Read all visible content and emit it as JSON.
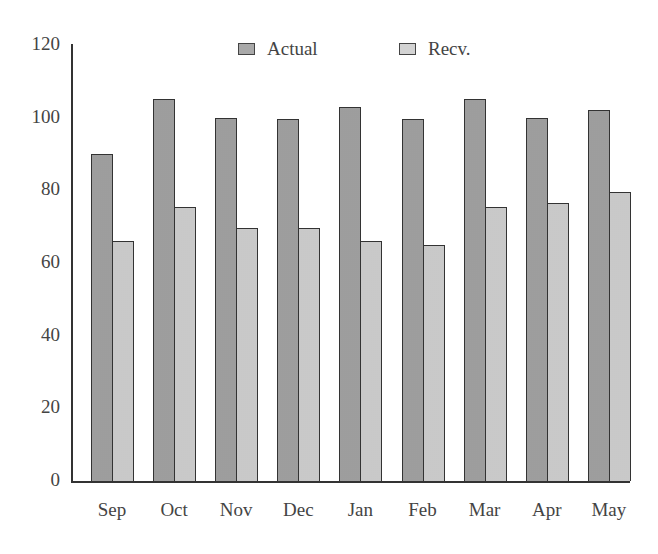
{
  "chart_data": {
    "type": "bar",
    "title": "",
    "xlabel": "",
    "ylabel": "",
    "categories": [
      "Sep",
      "Oct",
      "Nov",
      "Dec",
      "Jan",
      "Feb",
      "Mar",
      "Apr",
      "May"
    ],
    "series": [
      {
        "name": "Actual",
        "color": "#a9a9a9",
        "values": [
          90,
          105,
          100,
          99.5,
          103,
          99.5,
          105,
          100,
          102
        ]
      },
      {
        "name": "Recv.",
        "color": "#d3d3d3",
        "values": [
          66,
          75.5,
          69.5,
          69.5,
          66,
          65,
          75.5,
          76.5,
          79.5
        ]
      }
    ],
    "ylim": [
      0,
      120
    ],
    "yticks": [
      0,
      20,
      40,
      60,
      80,
      100,
      120
    ],
    "grid": false,
    "legend_position": "top"
  },
  "legend": {
    "actual_label": "Actual",
    "recv_label": "Recv."
  },
  "axis": {
    "yticks": [
      "0",
      "20",
      "40",
      "60",
      "80",
      "100",
      "120"
    ],
    "xticks": [
      "Sep",
      "Oct",
      "Nov",
      "Dec",
      "Jan",
      "Feb",
      "Mar",
      "Apr",
      "May"
    ]
  }
}
